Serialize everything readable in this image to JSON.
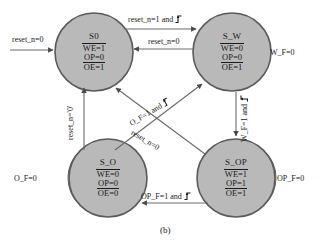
{
  "diagram": {
    "caption": "(b)",
    "type": "finite-state-machine",
    "colors": {
      "state_fill": "#b9b9b9",
      "state_stroke": "#5a5a5a",
      "edge_stroke": "#6a6a6a",
      "text": "#1a1a1a"
    },
    "states": [
      {
        "id": "S0",
        "name": "S0",
        "outputs": [
          {
            "signal": "WE",
            "value": "1",
            "overline": true,
            "text": "WE=1"
          },
          {
            "signal": "OP",
            "value": "0",
            "overline": false,
            "text": "OP=0"
          },
          {
            "signal": "OE",
            "value": "1",
            "overline": true,
            "text": "OE=1"
          }
        ]
      },
      {
        "id": "S_W",
        "name": "S_W",
        "outputs": [
          {
            "signal": "WE",
            "value": "0",
            "overline": true,
            "text": "WE=0"
          },
          {
            "signal": "OP",
            "value": "0",
            "overline": false,
            "text": "OP=0"
          },
          {
            "signal": "OE",
            "value": "1",
            "overline": true,
            "text": "OE=1"
          }
        ]
      },
      {
        "id": "S_O",
        "name": "S_O",
        "outputs": [
          {
            "signal": "WE",
            "value": "0",
            "overline": true,
            "text": "WE=0"
          },
          {
            "signal": "OP",
            "value": "0",
            "overline": false,
            "text": "OP=0"
          },
          {
            "signal": "OE",
            "value": "0",
            "overline": true,
            "text": "OE=0"
          }
        ]
      },
      {
        "id": "S_OP",
        "name": "S_OP",
        "outputs": [
          {
            "signal": "WE",
            "value": "1",
            "overline": true,
            "text": "WE=1"
          },
          {
            "signal": "OP",
            "value": "1",
            "overline": false,
            "text": "OP=1"
          },
          {
            "signal": "OE",
            "value": "1",
            "overline": true,
            "text": "OE=1"
          }
        ]
      }
    ],
    "transitions": [
      {
        "id": "reset-entry",
        "from": "",
        "to": "S0",
        "label": "reset_n=0",
        "edge_symbol": false
      },
      {
        "id": "s0-to-sw",
        "from": "S0",
        "to": "S_W",
        "label": "reset_n=1",
        "and": "and",
        "edge_symbol": true
      },
      {
        "id": "sw-to-s0",
        "from": "S_W",
        "to": "S0",
        "label": "reset_n=0",
        "edge_symbol": false
      },
      {
        "id": "so-to-s0",
        "from": "S_O",
        "to": "S0",
        "label": "reset_n='0'",
        "edge_symbol": false
      },
      {
        "id": "sop-to-s0",
        "from": "S_OP",
        "to": "S0",
        "label": "reset_n=0",
        "edge_symbol": false
      },
      {
        "id": "sop-to-sw",
        "from": "S_OP",
        "to": "S_W",
        "label": "O_F=1",
        "and": "and",
        "edge_symbol": true
      },
      {
        "id": "sw-to-sop",
        "from": "S_W",
        "to": "S_OP",
        "label": "W_F=1",
        "and": "and",
        "edge_symbol": true
      },
      {
        "id": "sop-to-so",
        "from": "S_OP",
        "to": "S_O",
        "label": "OP_F=1",
        "and": "and",
        "edge_symbol": true
      }
    ],
    "self_loops": [
      {
        "id": "sw-loop",
        "state": "S_W",
        "label": "W_F=0"
      },
      {
        "id": "so-loop",
        "state": "S_O",
        "label": "O_F=0"
      },
      {
        "id": "sop-loop",
        "state": "S_OP",
        "label": "OP_F=0"
      }
    ]
  }
}
